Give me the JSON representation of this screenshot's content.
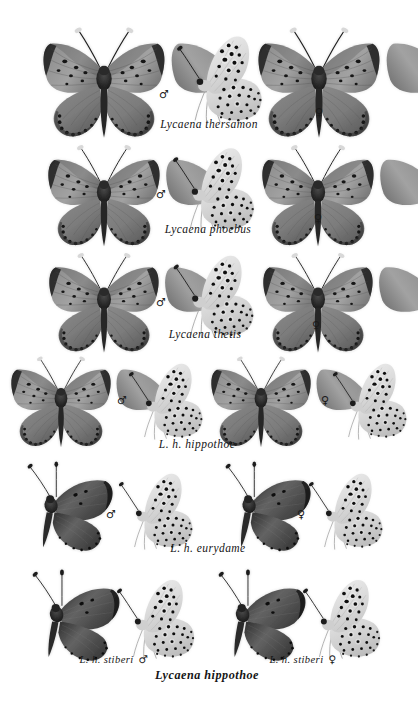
{
  "plate": {
    "title": "Lycaena butterfly specimen plate",
    "background": "#ffffff",
    "ink": "#1a1a1a",
    "rows": [
      {
        "id": "row-thersamon",
        "caption": "Lycaena thersamon",
        "male_symbol": "♂",
        "female_symbol": "♀",
        "specimens": [
          {
            "name": "thersamon-male-dorsal",
            "view": "dorsal",
            "sex": "male",
            "tone": "#8d8d8d"
          },
          {
            "name": "thersamon-male-ventral",
            "view": "ventral",
            "sex": "male",
            "tone": "#dcdcdc"
          },
          {
            "name": "thersamon-female-dorsal",
            "view": "dorsal",
            "sex": "female",
            "tone": "#7a7a7a"
          }
        ]
      },
      {
        "id": "row-phoebus",
        "caption": "Lycaena phoebus",
        "male_symbol": "♂",
        "female_symbol": "♀",
        "specimens": [
          {
            "name": "phoebus-male-dorsal",
            "view": "dorsal",
            "sex": "male",
            "tone": "#8a8a8a"
          },
          {
            "name": "phoebus-male-ventral",
            "view": "ventral",
            "sex": "male",
            "tone": "#dedede"
          },
          {
            "name": "phoebus-female-dorsal",
            "view": "dorsal",
            "sex": "female",
            "tone": "#868686"
          }
        ]
      },
      {
        "id": "row-thetis",
        "caption": "Lycaena thetis",
        "male_symbol": "♂",
        "female_symbol": "♀",
        "specimens": [
          {
            "name": "thetis-male-dorsal",
            "view": "dorsal",
            "sex": "male",
            "tone": "#9a9a9a"
          },
          {
            "name": "thetis-male-ventral",
            "view": "ventral",
            "sex": "male",
            "tone": "#e8e8e8"
          },
          {
            "name": "thetis-female-dorsal",
            "view": "dorsal",
            "sex": "female",
            "tone": "#9d9d9d"
          }
        ]
      },
      {
        "id": "row-hippothoe-hippothoe",
        "caption": "L. h. hippothoe",
        "male_symbol": "♂",
        "female_symbol": "♀",
        "specimens": [
          {
            "name": "hippothoe-male-dorsal",
            "view": "dorsal",
            "sex": "male",
            "tone": "#6f6f6f"
          },
          {
            "name": "hippothoe-male-ventral",
            "view": "ventral-side",
            "sex": "male",
            "tone": "#b9b9b9"
          },
          {
            "name": "hippothoe-female-dorsal",
            "view": "dorsal",
            "sex": "female",
            "tone": "#7d7d7d"
          },
          {
            "name": "hippothoe-female-ventral",
            "view": "ventral-side",
            "sex": "female",
            "tone": "#c2c2c2"
          }
        ]
      },
      {
        "id": "row-hippothoe-eurydame",
        "caption": "L. h. eurydame",
        "male_symbol": "♂",
        "female_symbol": "♀",
        "specimens": [
          {
            "name": "eurydame-male-dorsal",
            "view": "dorsal-angled",
            "sex": "male",
            "tone": "#5e5e5e"
          },
          {
            "name": "eurydame-male-ventral",
            "view": "ventral-side",
            "sex": "male",
            "tone": "#bdbdbd"
          },
          {
            "name": "eurydame-female-dorsal",
            "view": "dorsal-angled",
            "sex": "female",
            "tone": "#3c3c3c"
          },
          {
            "name": "eurydame-female-ventral",
            "view": "ventral-side",
            "sex": "female",
            "tone": "#c6c6c6"
          }
        ]
      },
      {
        "id": "row-hippothoe-stiberi",
        "caption_left": "L. h. stiberi",
        "caption_right": "L. h. stiberi",
        "caption_main": "Lycaena hippothoe",
        "male_symbol": "♂",
        "female_symbol": "♀",
        "specimens": [
          {
            "name": "stiberi-male-dorsal",
            "view": "dorsal-angled",
            "sex": "male",
            "tone": "#6a6a6a"
          },
          {
            "name": "stiberi-male-ventral",
            "view": "ventral-side",
            "sex": "male",
            "tone": "#b5b5b5"
          },
          {
            "name": "stiberi-female-dorsal",
            "view": "dorsal-angled",
            "sex": "female",
            "tone": "#6e6e6e"
          },
          {
            "name": "stiberi-female-ventral",
            "view": "ventral-side",
            "sex": "female",
            "tone": "#bcbcbc"
          }
        ]
      }
    ]
  }
}
